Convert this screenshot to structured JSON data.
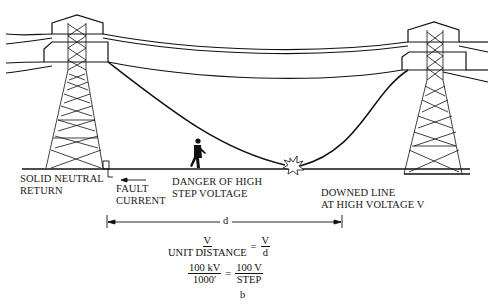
{
  "diagram": {
    "subfigure_label": "b",
    "labels": {
      "solid_neutral_return": [
        "SOLID NEUTRAL",
        "RETURN"
      ],
      "fault_current": [
        "FAULT",
        "CURRENT"
      ],
      "danger": [
        "DANGER OF HIGH",
        "STEP VOLTAGE"
      ],
      "downed_line": [
        "DOWNED LINE",
        "AT HIGH VOLTAGE V"
      ],
      "distance": "d"
    },
    "equation1": {
      "lhs_num": "V",
      "lhs_den": "UNIT DISTANCE",
      "eq": "=",
      "rhs_num": "V",
      "rhs_den": "d"
    },
    "equation2": {
      "lhs_num": "100 kV",
      "lhs_den": "1000′",
      "eq": "=",
      "rhs_num": "100 V",
      "rhs_den": "STEP"
    },
    "colors": {
      "ink": "#111111",
      "background": "#ffffff"
    }
  }
}
